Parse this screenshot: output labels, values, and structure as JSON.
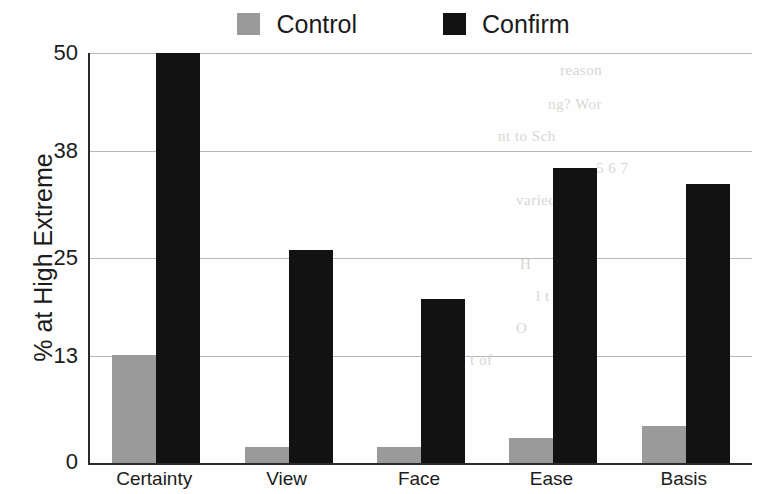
{
  "chart_data": {
    "type": "bar",
    "title": "",
    "xlabel": "",
    "ylabel": "% at High Extreme",
    "categories": [
      "Certainty",
      "View",
      "Face",
      "Ease",
      "Basis"
    ],
    "series": [
      {
        "name": "Control",
        "color": "#9a9a9a",
        "values": [
          13.2,
          2.0,
          2.0,
          3.0,
          4.5
        ]
      },
      {
        "name": "Confirm",
        "color": "#121212",
        "values": [
          50.0,
          26.0,
          20.0,
          36.0,
          34.0
        ]
      }
    ],
    "ylim": [
      0,
      50
    ],
    "yticks": [
      0,
      13,
      25,
      38,
      50
    ],
    "ytick_labels": [
      "0",
      "13",
      "25",
      "38",
      "50"
    ],
    "grid": true,
    "legend_position": "top-center"
  },
  "legend": {
    "entries": [
      {
        "label": "Control",
        "color": "#9a9a9a"
      },
      {
        "label": "Confirm",
        "color": "#121212"
      }
    ]
  },
  "background_text": {
    "lines": [
      "reason",
      "ng? Wor",
      "nt to Sch",
      "5 6 7",
      "varied t",
      "ain",
      "H",
      "l t",
      "O",
      "t of"
    ]
  }
}
